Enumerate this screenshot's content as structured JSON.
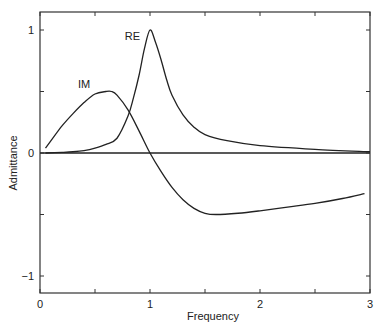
{
  "chart_data": {
    "type": "line",
    "title": "",
    "xlabel": "Frequency",
    "ylabel": "Admittance",
    "xlim": [
      0,
      3
    ],
    "ylim": [
      -1.15,
      1.15
    ],
    "x_ticks": [
      0,
      0.5,
      1,
      1.5,
      2,
      2.5,
      3
    ],
    "x_tick_labels": [
      "0",
      "",
      "1",
      "",
      "2",
      "",
      "3"
    ],
    "y_ticks": [
      -1,
      -0.5,
      0,
      0.5,
      1
    ],
    "y_tick_labels": [
      "−1",
      "",
      "0",
      "",
      "1"
    ],
    "grid": false,
    "legend": "inline labels",
    "zero_line": true,
    "series": [
      {
        "name": "RE",
        "label_pos": [
          0.84,
          0.92
        ],
        "x": [
          0.05,
          0.2,
          0.3,
          0.4,
          0.5,
          0.6,
          0.7,
          0.8,
          0.85,
          0.9,
          0.95,
          1.0,
          1.05,
          1.1,
          1.15,
          1.2,
          1.3,
          1.4,
          1.5,
          1.7,
          2.0,
          2.5,
          3.0
        ],
        "values": [
          0.0,
          0.005,
          0.01,
          0.02,
          0.04,
          0.07,
          0.12,
          0.3,
          0.45,
          0.63,
          0.85,
          1.0,
          0.9,
          0.76,
          0.6,
          0.47,
          0.31,
          0.21,
          0.15,
          0.1,
          0.06,
          0.03,
          0.01
        ]
      },
      {
        "name": "IM",
        "label_pos": [
          0.4,
          0.53
        ],
        "x": [
          0.05,
          0.1,
          0.2,
          0.3,
          0.4,
          0.5,
          0.6,
          0.65,
          0.7,
          0.8,
          0.9,
          1.0,
          1.1,
          1.2,
          1.3,
          1.4,
          1.5,
          1.6,
          1.8,
          2.0,
          2.25,
          2.5,
          2.75,
          2.95
        ],
        "values": [
          0.04,
          0.1,
          0.22,
          0.32,
          0.41,
          0.48,
          0.5,
          0.5,
          0.47,
          0.35,
          0.18,
          0.0,
          -0.15,
          -0.28,
          -0.38,
          -0.45,
          -0.49,
          -0.5,
          -0.49,
          -0.47,
          -0.44,
          -0.41,
          -0.37,
          -0.33
        ]
      }
    ]
  }
}
